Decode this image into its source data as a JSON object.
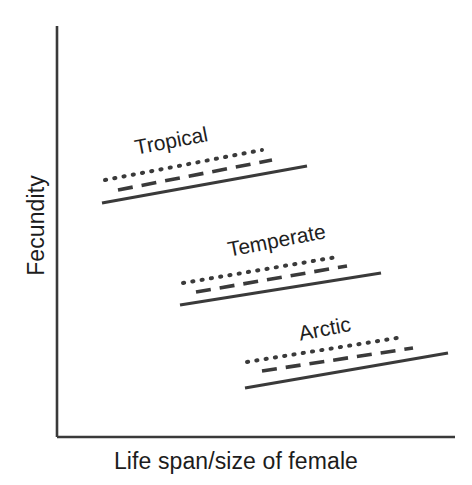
{
  "figure": {
    "background_color": "#ffffff",
    "stroke_color": "#3a3a3a",
    "text_color": "#1c1c1c"
  },
  "axes": {
    "y_title": "Fecundity",
    "x_title": "Life span/size of female",
    "origin": [
      57,
      437
    ],
    "y_top": 26,
    "x_right": 455
  },
  "chart_data": {
    "type": "line",
    "title": "",
    "subtitle": "",
    "xlabel": "Life span/size of female",
    "ylabel": "Fecundity",
    "xlim": [
      0,
      1
    ],
    "ylim": [
      0,
      1
    ],
    "grid": false,
    "axis_ticks": false,
    "tick_labels": [],
    "legend": "inline group labels",
    "legend_position": "inline",
    "annotations": [
      "Tropical",
      "Temperate",
      "Arctic"
    ],
    "line_styles": [
      "dotted",
      "dashed",
      "solid"
    ],
    "groups": [
      {
        "name": "Tropical",
        "label_x": 135,
        "label_y": 150,
        "label_rotation": -11,
        "series": [
          {
            "name": "Tropical dotted",
            "style": "dotted",
            "x": [
              105,
              262
            ],
            "y": [
              180,
              150
            ]
          },
          {
            "name": "Tropical dashed",
            "style": "dashed",
            "x": [
              118,
              272
            ],
            "y": [
              190,
              160
            ]
          },
          {
            "name": "Tropical solid",
            "style": "solid",
            "x": [
              102,
              307
            ],
            "y": [
              203,
              166
            ]
          }
        ]
      },
      {
        "name": "Temperate",
        "label_x": 228,
        "label_y": 252,
        "label_rotation": -11,
        "series": [
          {
            "name": "Temperate dotted",
            "style": "dotted",
            "x": [
              183,
              337
            ],
            "y": [
              283,
              257
            ]
          },
          {
            "name": "Temperate dashed",
            "style": "dashed",
            "x": [
              196,
              347
            ],
            "y": [
              292,
              266
            ]
          },
          {
            "name": "Temperate solid",
            "style": "solid",
            "x": [
              180,
              381
            ],
            "y": [
              305,
              273
            ]
          }
        ]
      },
      {
        "name": "Arctic",
        "label_x": 299,
        "label_y": 336,
        "label_rotation": -11,
        "series": [
          {
            "name": "Arctic dotted",
            "style": "dotted",
            "x": [
              247,
              403
            ],
            "y": [
              362,
              337
            ]
          },
          {
            "name": "Arctic dashed",
            "style": "dashed",
            "x": [
              262,
              413
            ],
            "y": [
              371,
              348
            ]
          },
          {
            "name": "Arctic solid",
            "style": "solid",
            "x": [
              245,
              448
            ],
            "y": [
              388,
              353
            ]
          }
        ]
      }
    ]
  }
}
